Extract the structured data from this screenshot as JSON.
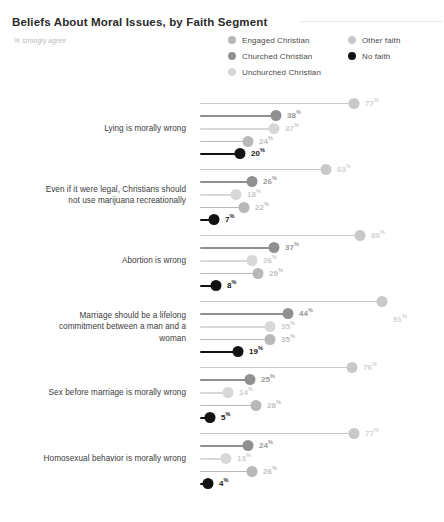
{
  "header": {
    "title": "Beliefs About Moral Issues, by Faith Segment",
    "subtitle": "% strongly agree"
  },
  "legend": {
    "column_a": [
      {
        "label": "Engaged Christian",
        "color": "#b8b8b8"
      },
      {
        "label": "Churched Christian",
        "color": "#909090"
      },
      {
        "label": "Unchurched Christian",
        "color": "#d8d8d8"
      }
    ],
    "column_b": [
      {
        "label": "Other faith",
        "color": "#c9c9c9"
      },
      {
        "label": "No faith",
        "color": "#121212"
      }
    ]
  },
  "chart_data": {
    "type": "bar",
    "title": "Beliefs About Moral Issues, by Faith Segment",
    "subtitle": "% strongly agree",
    "xlabel": "",
    "ylabel": "",
    "xlim": [
      0,
      100
    ],
    "grid": false,
    "legend_position": "top-right",
    "value_suffix": "%",
    "categories": [
      "Lying is morally wrong",
      "Even if it were legal, Christians should not use marijuana recreationally",
      "Abortion is wrong",
      "Marriage should be a lifelong commitment between a man and a woman",
      "Sex before marriage is morally wrong",
      "Homosexual behavior is morally wrong"
    ],
    "series": [
      {
        "name": "Other faith",
        "color": "#c9c9c9",
        "values": [
          77,
          63,
          80,
          91,
          76,
          77
        ]
      },
      {
        "name": "Churched Christian",
        "color": "#909090",
        "values": [
          38,
          26,
          37,
          44,
          25,
          24
        ]
      },
      {
        "name": "Unchurched Christian",
        "color": "#d8d8d8",
        "values": [
          37,
          18,
          26,
          35,
          14,
          13
        ]
      },
      {
        "name": "Engaged Christian",
        "color": "#b8b8b8",
        "values": [
          24,
          22,
          29,
          35,
          28,
          26
        ]
      },
      {
        "name": "No faith",
        "color": "#121212",
        "values": [
          20,
          7,
          8,
          19,
          5,
          4
        ]
      }
    ]
  },
  "groups": [
    {
      "label": "Lying is morally wrong",
      "label_lines": [
        "Lying is morally wrong"
      ],
      "rows": [
        {
          "series": "Other faith",
          "value": 77,
          "label": "77",
          "color": "#c9c9c9",
          "text_color": "#d2d2d2",
          "label_below": false
        },
        {
          "series": "Churched Christian",
          "value": 38,
          "label": "38",
          "color": "#909090",
          "text_color": "#999999",
          "label_below": false
        },
        {
          "series": "Unchurched Christian",
          "value": 37,
          "label": "37",
          "color": "#d8d8d8",
          "text_color": "#cccccc",
          "label_below": false
        },
        {
          "series": "Engaged Christian",
          "value": 24,
          "label": "24",
          "color": "#b8b8b8",
          "text_color": "#c0c0c0",
          "label_below": false
        },
        {
          "series": "No faith",
          "value": 20,
          "label": "20",
          "color": "#121212",
          "text_color": "#1a1a1a",
          "label_below": false
        }
      ]
    },
    {
      "label": "Even if it were legal, Christians should not use marijuana recreationally",
      "label_lines": [
        "Even if it were legal, Christians should",
        "not use marijuana recreationally"
      ],
      "rows": [
        {
          "series": "Other faith",
          "value": 63,
          "label": "63",
          "color": "#c9c9c9",
          "text_color": "#d2d2d2",
          "label_below": false
        },
        {
          "series": "Churched Christian",
          "value": 26,
          "label": "26",
          "color": "#909090",
          "text_color": "#999999",
          "label_below": false
        },
        {
          "series": "Unchurched Christian",
          "value": 18,
          "label": "18",
          "color": "#d8d8d8",
          "text_color": "#cccccc",
          "label_below": false
        },
        {
          "series": "Engaged Christian",
          "value": 22,
          "label": "22",
          "color": "#b8b8b8",
          "text_color": "#c0c0c0",
          "label_below": false
        },
        {
          "series": "No faith",
          "value": 7,
          "label": "7",
          "color": "#121212",
          "text_color": "#1a1a1a",
          "label_below": false
        }
      ]
    },
    {
      "label": "Abortion is wrong",
      "label_lines": [
        "Abortion is wrong"
      ],
      "rows": [
        {
          "series": "Other faith",
          "value": 80,
          "label": "80",
          "color": "#c9c9c9",
          "text_color": "#d2d2d2",
          "label_below": false
        },
        {
          "series": "Churched Christian",
          "value": 37,
          "label": "37",
          "color": "#909090",
          "text_color": "#999999",
          "label_below": false
        },
        {
          "series": "Unchurched Christian",
          "value": 26,
          "label": "26",
          "color": "#d8d8d8",
          "text_color": "#cccccc",
          "label_below": false
        },
        {
          "series": "Engaged Christian",
          "value": 29,
          "label": "29",
          "color": "#b8b8b8",
          "text_color": "#c0c0c0",
          "label_below": false
        },
        {
          "series": "No faith",
          "value": 8,
          "label": "8",
          "color": "#121212",
          "text_color": "#1a1a1a",
          "label_below": false
        }
      ]
    },
    {
      "label": "Marriage should be a lifelong commitment between a man and a woman",
      "label_lines": [
        "Marriage should be a lifelong",
        "commitment between a man and a",
        "woman"
      ],
      "rows": [
        {
          "series": "Other faith",
          "value": 91,
          "label": "91",
          "color": "#c9c9c9",
          "text_color": "#d2d2d2",
          "label_below": true
        },
        {
          "series": "Churched Christian",
          "value": 44,
          "label": "44",
          "color": "#909090",
          "text_color": "#999999",
          "label_below": false
        },
        {
          "series": "Unchurched Christian",
          "value": 35,
          "label": "35",
          "color": "#d8d8d8",
          "text_color": "#cccccc",
          "label_below": false
        },
        {
          "series": "Engaged Christian",
          "value": 35,
          "label": "35",
          "color": "#b8b8b8",
          "text_color": "#c0c0c0",
          "label_below": false
        },
        {
          "series": "No faith",
          "value": 19,
          "label": "19",
          "color": "#121212",
          "text_color": "#1a1a1a",
          "label_below": false
        }
      ]
    },
    {
      "label": "Sex before marriage is morally wrong",
      "label_lines": [
        "Sex before marriage is morally wrong"
      ],
      "rows": [
        {
          "series": "Other faith",
          "value": 76,
          "label": "76",
          "color": "#c9c9c9",
          "text_color": "#d2d2d2",
          "label_below": false
        },
        {
          "series": "Churched Christian",
          "value": 25,
          "label": "25",
          "color": "#909090",
          "text_color": "#999999",
          "label_below": false
        },
        {
          "series": "Unchurched Christian",
          "value": 14,
          "label": "14",
          "color": "#d8d8d8",
          "text_color": "#cccccc",
          "label_below": false
        },
        {
          "series": "Engaged Christian",
          "value": 28,
          "label": "28",
          "color": "#b8b8b8",
          "text_color": "#c0c0c0",
          "label_below": false
        },
        {
          "series": "No faith",
          "value": 5,
          "label": "5",
          "color": "#121212",
          "text_color": "#1a1a1a",
          "label_below": false
        }
      ]
    },
    {
      "label": "Homosexual behavior is morally wrong",
      "label_lines": [
        "Homosexual behavior is morally wrong"
      ],
      "rows": [
        {
          "series": "Other faith",
          "value": 77,
          "label": "77",
          "color": "#c9c9c9",
          "text_color": "#d2d2d2",
          "label_below": false
        },
        {
          "series": "Churched Christian",
          "value": 24,
          "label": "24",
          "color": "#909090",
          "text_color": "#999999",
          "label_below": false
        },
        {
          "series": "Unchurched Christian",
          "value": 13,
          "label": "13",
          "color": "#d8d8d8",
          "text_color": "#cccccc",
          "label_below": false
        },
        {
          "series": "Engaged Christian",
          "value": 26,
          "label": "26",
          "color": "#b8b8b8",
          "text_color": "#c0c0c0",
          "label_below": false
        },
        {
          "series": "No faith",
          "value": 4,
          "label": "4",
          "color": "#121212",
          "text_color": "#1a1a1a",
          "label_below": false
        }
      ]
    }
  ],
  "percent_symbol": "%"
}
